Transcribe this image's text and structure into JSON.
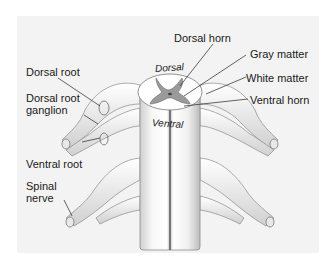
{
  "diagram": {
    "labels_left": [
      {
        "id": "dorsal_root",
        "text": "Dorsal root"
      },
      {
        "id": "dorsal_root_ganglion_1",
        "text": "Dorsal root"
      },
      {
        "id": "dorsal_root_ganglion_2",
        "text": "ganglion"
      },
      {
        "id": "ventral_root",
        "text": "Ventral root"
      },
      {
        "id": "spinal_nerve_1",
        "text": "Spinal"
      },
      {
        "id": "spinal_nerve_2",
        "text": "nerve"
      }
    ],
    "labels_right": [
      {
        "id": "dorsal_horn",
        "text": "Dorsal horn"
      },
      {
        "id": "gray_matter",
        "text": "Gray matter"
      },
      {
        "id": "white_matter",
        "text": "White matter"
      },
      {
        "id": "ventral_horn",
        "text": "Ventral horn"
      }
    ],
    "orientation": {
      "dorsal": "Dorsal",
      "ventral": "Ventral"
    },
    "colors": {
      "background": "#f3f3f3",
      "gray_matter": "#9a9a9a",
      "white_matter": "#ffffff",
      "outline": "#555555"
    }
  }
}
